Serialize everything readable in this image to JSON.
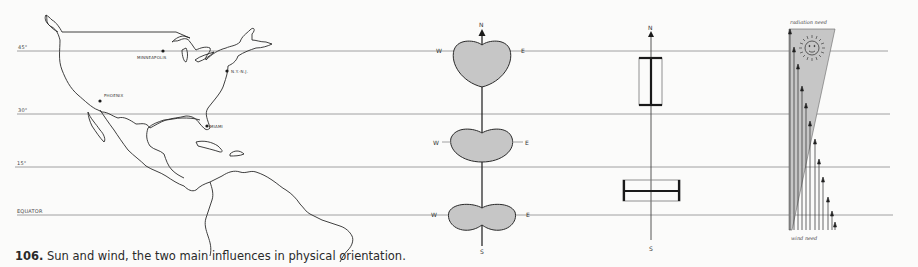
{
  "figure": {
    "number": "106.",
    "caption": "Sun and wind, the two main influences in physical orientation."
  },
  "latitudes": [
    {
      "label": "45°",
      "y": 51
    },
    {
      "label": "30°",
      "y": 114
    },
    {
      "label": "15°",
      "y": 167
    },
    {
      "label": "EQUATOR",
      "y": 215
    }
  ],
  "map": {
    "cities": [
      {
        "name": "MINNEAPOLIS",
        "x": 163,
        "y": 51
      },
      {
        "name": "N.Y.-N.J.",
        "x": 227,
        "y": 71
      },
      {
        "name": "PHOENIX",
        "x": 100,
        "y": 101
      },
      {
        "name": "MIAMI",
        "x": 207,
        "y": 126
      }
    ]
  },
  "orientation_diagram": {
    "north": "N",
    "south": "S",
    "west": "W",
    "east": "E",
    "shapes": [
      {
        "latitude": "45°",
        "shape": "heart-shaped lobe"
      },
      {
        "latitude": "30°",
        "shape": "kidney-shaped lobe"
      },
      {
        "latitude": "Equator",
        "shape": "peanut-shaped lobe"
      }
    ]
  },
  "building_diagram": {
    "north": "N",
    "south": "S",
    "forms": [
      {
        "latitude": "45°",
        "orientation": "elongated north-south"
      },
      {
        "latitude": "Equator",
        "orientation": "elongated east-west"
      }
    ]
  },
  "sun_wind_diagram": {
    "top_label": "radiation need",
    "bottom_label": "wind need"
  },
  "colors": {
    "background": "#fbfbfa",
    "line": "#777777",
    "ink": "#2a2a2a",
    "fill": "#c6c6c6"
  }
}
